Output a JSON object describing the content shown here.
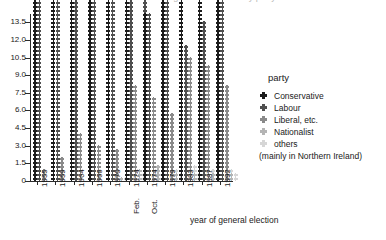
{
  "chart_data": {
    "type": "bar",
    "title": "Votes cast at UK general elections by party",
    "xlabel": "year of general election",
    "ylabel": "",
    "ylim": [
      0,
      14.2
    ],
    "ytick_labels": [
      "0",
      "1.5",
      "3.0",
      "4.5",
      "6.0",
      "7.5",
      "9.0",
      "10.5",
      "12.0",
      "13.5"
    ],
    "ytick_values": [
      0,
      1.5,
      3.0,
      4.5,
      6.0,
      7.5,
      9.0,
      10.5,
      12.0,
      13.5
    ],
    "grid": false,
    "legend_position": "right",
    "unit_per_dot": 0.25,
    "categories": [
      "1955",
      "1959",
      "1964",
      "1966",
      "1970",
      "1974",
      "1974",
      "1979",
      "1983",
      "1987",
      "1992"
    ],
    "category_sublabels": [
      "",
      "",
      "",
      "",
      "",
      "Feb.",
      "Oct.",
      "",
      "",
      "",
      ""
    ],
    "series": [
      {
        "name": "Conservative",
        "color": "#1c1c1c",
        "values": [
          13.3,
          13.7,
          12.0,
          11.4,
          13.1,
          11.9,
          10.5,
          13.7,
          13.0,
          13.7,
          14.1
        ]
      },
      {
        "name": "Labour",
        "color": "#4f4f4f",
        "values": [
          12.4,
          12.2,
          12.2,
          13.1,
          12.2,
          11.6,
          11.5,
          11.5,
          8.5,
          10.0,
          11.6
        ]
      },
      {
        "name": "Liberal, etc.",
        "color": "#8a8a8a",
        "values": [
          0.7,
          1.6,
          3.1,
          2.3,
          2.1,
          6.1,
          5.3,
          4.3,
          7.8,
          7.3,
          6.0
        ]
      },
      {
        "name": "Nationalist",
        "color": "#b4b4b4",
        "values": [
          0.1,
          0.1,
          0.1,
          0.1,
          0.3,
          0.8,
          1.0,
          0.6,
          0.5,
          0.5,
          0.6
        ]
      },
      {
        "name": "others",
        "color": "#d6d6d6",
        "values": [
          0.1,
          0.1,
          0.1,
          0.1,
          0.2,
          0.5,
          0.5,
          0.7,
          0.9,
          0.8,
          0.8
        ]
      }
    ]
  },
  "legend": {
    "title": "party",
    "entries": [
      {
        "label": "Conservative",
        "color": "#1c1c1c"
      },
      {
        "label": "Labour",
        "color": "#4f4f4f"
      },
      {
        "label": "Liberal, etc.",
        "color": "#8a8a8a"
      },
      {
        "label": "Nationalist",
        "color": "#b4b4b4"
      },
      {
        "label": "others",
        "color": "#d6d6d6"
      }
    ],
    "note": "(mainly in Northern Ireland)"
  }
}
